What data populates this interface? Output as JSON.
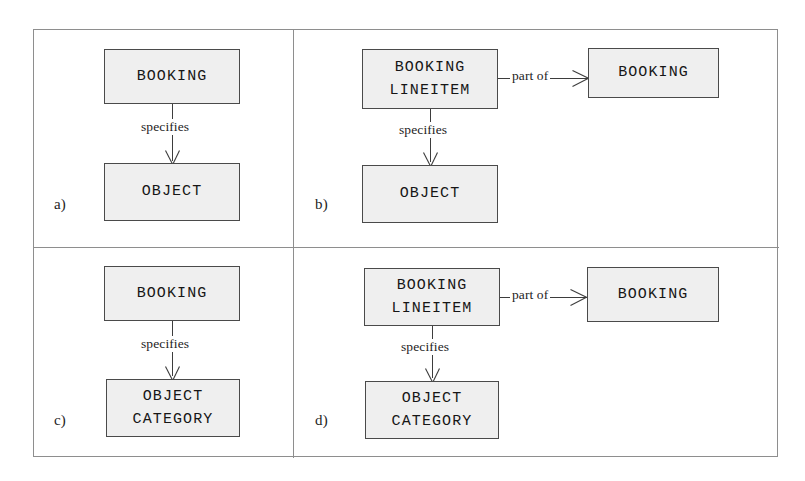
{
  "figure": {
    "panels": [
      {
        "id": "a",
        "label": "a)",
        "entities": [
          {
            "name": "booking",
            "lines": [
              "BOOKING"
            ]
          },
          {
            "name": "object",
            "lines": [
              "OBJECT"
            ]
          }
        ],
        "relationships": [
          {
            "name": "specifies",
            "label": "specifies",
            "direction": "down"
          }
        ]
      },
      {
        "id": "b",
        "label": "b)",
        "entities": [
          {
            "name": "booking-lineitem",
            "lines": [
              "BOOKING",
              "LINEITEM"
            ]
          },
          {
            "name": "booking",
            "lines": [
              "BOOKING"
            ]
          },
          {
            "name": "object",
            "lines": [
              "OBJECT"
            ]
          }
        ],
        "relationships": [
          {
            "name": "part-of",
            "label": "part of",
            "direction": "right"
          },
          {
            "name": "specifies",
            "label": "specifies",
            "direction": "down"
          }
        ]
      },
      {
        "id": "c",
        "label": "c)",
        "entities": [
          {
            "name": "booking",
            "lines": [
              "BOOKING"
            ]
          },
          {
            "name": "object-category",
            "lines": [
              "OBJECT",
              "CATEGORY"
            ]
          }
        ],
        "relationships": [
          {
            "name": "specifies",
            "label": "specifies",
            "direction": "down"
          }
        ]
      },
      {
        "id": "d",
        "label": "d)",
        "entities": [
          {
            "name": "booking-lineitem",
            "lines": [
              "BOOKING",
              "LINEITEM"
            ]
          },
          {
            "name": "booking",
            "lines": [
              "BOOKING"
            ]
          },
          {
            "name": "object-category",
            "lines": [
              "OBJECT",
              "CATEGORY"
            ]
          }
        ],
        "relationships": [
          {
            "name": "part-of",
            "label": "part of",
            "direction": "right"
          },
          {
            "name": "specifies",
            "label": "specifies",
            "direction": "down"
          }
        ]
      }
    ],
    "text": {
      "booking": "BOOKING",
      "lineitem": "LINEITEM",
      "object": "OBJECT",
      "category": "CATEGORY",
      "specifies": "specifies",
      "part_of": "part of",
      "label_a": "a)",
      "label_b": "b)",
      "label_c": "c)",
      "label_d": "d)"
    },
    "colors": {
      "box_fill": "#efefef",
      "box_border": "#4a4a4a",
      "line": "#3d3d3d",
      "frame": "#8e8e8e",
      "text": "#161616",
      "background": "#ffffff"
    }
  }
}
